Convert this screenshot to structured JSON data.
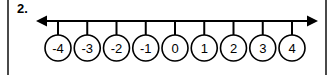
{
  "worksheet": {
    "problem_number": "2.",
    "background_color": "#ffffff",
    "ink_color": "#000000",
    "scan_edge_color": "#4a4a4a"
  },
  "chart_data": {
    "type": "number-line",
    "title": "",
    "xlabel": "",
    "ylabel": "",
    "grid": false,
    "legend": null,
    "axis_arrows": {
      "left": true,
      "right": true
    },
    "tick_marks": 9,
    "xlim": [
      -4.6,
      4.6
    ],
    "categories": [
      "-4",
      "-3",
      "-2",
      "-1",
      "0",
      "1",
      "2",
      "3",
      "4"
    ],
    "values": [
      -4,
      -3,
      -2,
      -1,
      0,
      1,
      2,
      3,
      4
    ],
    "point_style": "circled-label",
    "labels": [
      {
        "value": -4,
        "text": "-4"
      },
      {
        "value": -3,
        "text": "-3"
      },
      {
        "value": -2,
        "text": "-2"
      },
      {
        "value": -1,
        "text": "-1"
      },
      {
        "value": 0,
        "text": "0"
      },
      {
        "value": 1,
        "text": "1"
      },
      {
        "value": 2,
        "text": "2"
      },
      {
        "value": 3,
        "text": "3"
      },
      {
        "value": 4,
        "text": "4"
      }
    ]
  },
  "geometry": {
    "axis_y": 21,
    "axis_start_x": 36,
    "axis_end_x": 318,
    "first_tick_x": 58,
    "tick_spacing": 29.25,
    "tick_bottom_y": 35,
    "circle_center_y": 48,
    "circle_radius": 13
  }
}
